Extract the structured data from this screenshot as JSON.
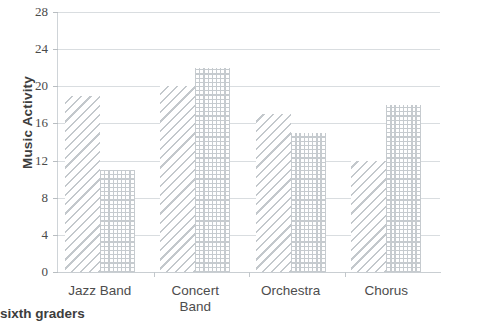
{
  "chart_data": {
    "type": "bar",
    "title": "",
    "xlabel": "",
    "ylabel": "Music Activity",
    "categories": [
      "Jazz Band",
      "Concert\nBand",
      "Orchestra",
      "Chorus"
    ],
    "series": [
      {
        "name": "series-1",
        "pattern": "diagonal-hatch",
        "values": [
          19,
          20,
          17,
          12
        ]
      },
      {
        "name": "series-2",
        "pattern": "dotted-grid",
        "values": [
          11,
          22,
          15,
          18
        ]
      }
    ],
    "ylim": [
      0,
      28
    ],
    "yticks": [
      0,
      4,
      8,
      12,
      16,
      20,
      24,
      28
    ],
    "ytick_labels": [
      "0",
      "4",
      "8",
      "12",
      "16",
      "20",
      "24",
      "28"
    ],
    "grid": true,
    "legend": "none",
    "caption": "sixth graders",
    "colors": {
      "gridline": "#d9dde0",
      "axis": "#c9ced2",
      "bar_pattern": "#c3c8cc",
      "text": "#4a4a4a",
      "background": "#ffffff"
    }
  }
}
